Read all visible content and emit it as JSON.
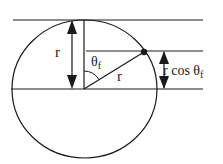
{
  "diagram": {
    "labels": {
      "left_radius": "r",
      "angle": "θ",
      "angle_sub": "f",
      "hyp_radius": "r",
      "proj_prefix": "r cos θ",
      "proj_sub": "f"
    },
    "colors": {
      "stroke": "#1a1a1a",
      "background": "#ffffff"
    }
  }
}
